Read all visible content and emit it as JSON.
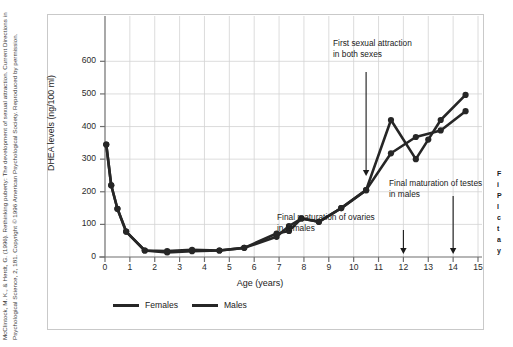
{
  "figure": {
    "credit": "McClintock, M. K., & Herdt, G. (1996). Rethinking puberty: The development of sexual attraction. Current Directions in Psychological Science, 2, 181. Copyright © 1996 American Psychological Society. Reproduced by permission."
  },
  "side_note": {
    "lines": [
      "F",
      "i",
      "P",
      "l",
      "c",
      "t",
      "a",
      "y"
    ]
  },
  "chart_data": {
    "type": "line",
    "title": "",
    "xlabel": "Age (years)",
    "ylabel": "DHEA levels (ng/100 ml)",
    "xlim": [
      0,
      15
    ],
    "ylim": [
      0,
      650
    ],
    "xticks": [
      0,
      1,
      2,
      3,
      4,
      5,
      6,
      7,
      8,
      9,
      10,
      11,
      12,
      13,
      14,
      15
    ],
    "yticks": [
      0,
      100,
      200,
      300,
      400,
      500,
      600
    ],
    "grid": true,
    "legend_position": "below-plot-left",
    "series": [
      {
        "name": "Females",
        "color": "#262626",
        "points": [
          [
            0.05,
            345
          ],
          [
            0.25,
            220
          ],
          [
            0.5,
            148
          ],
          [
            0.85,
            78
          ],
          [
            1.6,
            20
          ],
          [
            2.5,
            14
          ],
          [
            3.5,
            18
          ],
          [
            4.6,
            20
          ],
          [
            5.6,
            28
          ],
          [
            6.9,
            62
          ],
          [
            7.4,
            95
          ],
          [
            7.9,
            118
          ],
          [
            8.6,
            108
          ],
          [
            9.5,
            150
          ],
          [
            10.5,
            205
          ],
          [
            11.5,
            420
          ],
          [
            12.5,
            300
          ],
          [
            13.0,
            360
          ],
          [
            13.5,
            420
          ],
          [
            14.5,
            497
          ]
        ]
      },
      {
        "name": "Males",
        "color": "#262626",
        "points": [
          [
            0.05,
            345
          ],
          [
            0.25,
            220
          ],
          [
            0.5,
            148
          ],
          [
            0.85,
            78
          ],
          [
            1.6,
            20
          ],
          [
            2.5,
            18
          ],
          [
            3.5,
            22
          ],
          [
            4.6,
            20
          ],
          [
            5.6,
            28
          ],
          [
            6.9,
            72
          ],
          [
            7.4,
            80
          ],
          [
            7.9,
            118
          ],
          [
            8.6,
            108
          ],
          [
            9.5,
            150
          ],
          [
            10.5,
            205
          ],
          [
            11.5,
            318
          ],
          [
            12.5,
            368
          ],
          [
            13.5,
            388
          ],
          [
            14.5,
            447
          ]
        ]
      }
    ],
    "annotations": [
      {
        "id": "first-sexual-attraction",
        "text": "First sexual attraction in both sexes",
        "arrow_to_age": 10.5
      },
      {
        "id": "final-maturation-testes",
        "text": "Final maturation of testes in males",
        "arrow_to_age": 14
      },
      {
        "id": "final-maturation-ovaries",
        "text": "Final maturation of ovaries in females",
        "arrow_to_age": 12
      }
    ]
  }
}
